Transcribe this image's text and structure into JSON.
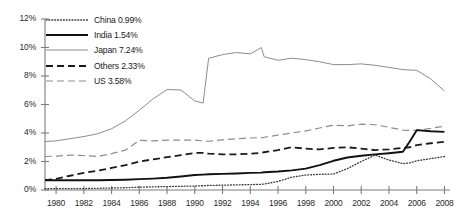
{
  "chart_data": {
    "type": "line",
    "title": "",
    "subtitle": "",
    "xlabel": "",
    "ylabel": "",
    "xlim": [
      1979.2,
      2008.4
    ],
    "ylim": [
      0,
      12
    ],
    "grid": false,
    "legend_position": "top-left inside plot",
    "y_ticks": [
      "0%",
      "2%",
      "4%",
      "6%",
      "8%",
      "10%",
      "12%"
    ],
    "y_tick_values": [
      0,
      2,
      4,
      6,
      8,
      10,
      12
    ],
    "x_ticks": [
      "1980",
      "1982",
      "1984",
      "1986",
      "1988",
      "1990",
      "1992",
      "1994",
      "1996",
      "1998",
      "2000",
      "2002",
      "2004",
      "2006",
      "2008"
    ],
    "x_tick_values": [
      1980,
      1982,
      1984,
      1986,
      1988,
      1990,
      1992,
      1994,
      1996,
      1998,
      2000,
      2002,
      2004,
      2006,
      2008
    ],
    "x": [
      1979.2,
      1980,
      1981,
      1982,
      1983,
      1984,
      1985,
      1986,
      1987,
      1988,
      1989,
      1990,
      1990.6,
      1991,
      1992,
      1993,
      1994,
      1994.8,
      1995,
      1996,
      1997,
      1998,
      1999,
      2000,
      2001,
      2002,
      2003,
      2004,
      2005,
      2005.5,
      2006,
      2007,
      2008
    ],
    "series": [
      {
        "name": "China",
        "label": "China 0.99%",
        "legend_value": "0.99%",
        "style": "dotted",
        "color": "#3a3a3a",
        "values": [
          0.1,
          0.1,
          0.1,
          0.1,
          0.12,
          0.14,
          0.16,
          0.2,
          0.22,
          0.24,
          0.26,
          0.28,
          0.3,
          0.32,
          0.34,
          0.36,
          0.38,
          0.4,
          0.42,
          0.6,
          0.9,
          1.05,
          1.1,
          1.12,
          1.5,
          2.0,
          2.45,
          2.1,
          1.85,
          1.9,
          2.05,
          2.2,
          2.35
        ]
      },
      {
        "name": "India",
        "label": "India 1.54%",
        "legend_value": "1.54%",
        "style": "solid-thick",
        "color": "#111111",
        "values": [
          0.68,
          0.68,
          0.68,
          0.68,
          0.68,
          0.7,
          0.72,
          0.76,
          0.8,
          0.86,
          0.95,
          1.05,
          1.08,
          1.1,
          1.13,
          1.16,
          1.2,
          1.22,
          1.25,
          1.3,
          1.38,
          1.5,
          1.75,
          2.05,
          2.28,
          2.4,
          2.5,
          2.58,
          2.68,
          3.4,
          4.2,
          4.12,
          4.08
        ]
      },
      {
        "name": "Japan",
        "label": "Japan 7.24%",
        "legend_value": "7.24%",
        "style": "solid-thin",
        "color": "#8c8c8c",
        "values": [
          3.4,
          3.45,
          3.6,
          3.75,
          3.95,
          4.3,
          4.85,
          5.6,
          6.4,
          7.05,
          7.02,
          6.25,
          6.1,
          9.25,
          9.5,
          9.65,
          9.55,
          10.0,
          9.35,
          9.1,
          9.25,
          9.15,
          9.0,
          8.8,
          8.8,
          8.85,
          8.75,
          8.6,
          8.45,
          8.42,
          8.4,
          7.8,
          6.95
        ]
      },
      {
        "name": "Others",
        "label": "Others 2.33%",
        "legend_value": "2.33%",
        "style": "dashed-thick",
        "color": "#1a1a1a",
        "values": [
          0.7,
          0.78,
          1.0,
          1.2,
          1.35,
          1.55,
          1.75,
          2.0,
          2.15,
          2.3,
          2.45,
          2.6,
          2.6,
          2.55,
          2.5,
          2.5,
          2.55,
          2.6,
          2.65,
          2.8,
          3.0,
          2.9,
          2.85,
          2.95,
          3.0,
          2.9,
          2.8,
          2.85,
          2.95,
          3.0,
          3.15,
          3.28,
          3.38
        ]
      },
      {
        "name": "US",
        "label": "US 3.58%",
        "legend_value": "3.58%",
        "style": "dashed-thin",
        "color": "#8c8c8c",
        "values": [
          2.35,
          2.38,
          2.45,
          2.42,
          2.35,
          2.55,
          2.8,
          3.48,
          3.45,
          3.5,
          3.5,
          3.5,
          3.45,
          3.42,
          3.52,
          3.6,
          3.65,
          3.68,
          3.7,
          3.85,
          4.0,
          4.15,
          4.35,
          4.55,
          4.5,
          4.62,
          4.58,
          4.4,
          4.2,
          4.18,
          4.2,
          4.32,
          4.48
        ]
      }
    ]
  },
  "axes": {
    "y_labels": [
      "12%",
      "10%",
      "8%",
      "6%",
      "4%",
      "2%",
      "0%"
    ],
    "x_labels": [
      "1980",
      "1982",
      "1984",
      "1986",
      "1988",
      "1990",
      "1992",
      "1994",
      "1996",
      "1998",
      "2000",
      "2002",
      "2004",
      "2006",
      "2008"
    ]
  },
  "legend": {
    "items": [
      {
        "label": "China 0.99%",
        "style": "dotted"
      },
      {
        "label": "India 1.54%",
        "style": "solid-thick"
      },
      {
        "label": "Japan 7.24%",
        "style": "solid-thin"
      },
      {
        "label": "Others 2.33%",
        "style": "dashed-thick"
      },
      {
        "label": "US 3.58%",
        "style": "dashed-thin"
      }
    ]
  },
  "colors": {
    "axis": "#7d7d7d",
    "text": "#1a1a1a",
    "gray_series": "#8c8c8c",
    "black_series": "#111111",
    "background": "#ffffff"
  }
}
